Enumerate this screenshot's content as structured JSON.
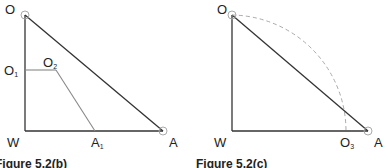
{
  "figures": [
    {
      "id": "fig_b",
      "caption": "Figure 5.2(b)",
      "labels": {
        "O": "O",
        "O1_main": "O",
        "O1_sub": "1",
        "O2_main": "O",
        "O2_sub": "2",
        "W": "W",
        "A1_main": "A",
        "A1_sub": "1",
        "A": "A"
      }
    },
    {
      "id": "fig_c",
      "caption": "Figure 5.2(c)",
      "labels": {
        "O": "O",
        "W": "W",
        "O3_main": "O",
        "O3_sub": "3",
        "A": "A"
      }
    }
  ],
  "colors": {
    "main_line": "#333333",
    "secondary_line": "#888888",
    "dashed_arc": "#aaaaaa"
  }
}
